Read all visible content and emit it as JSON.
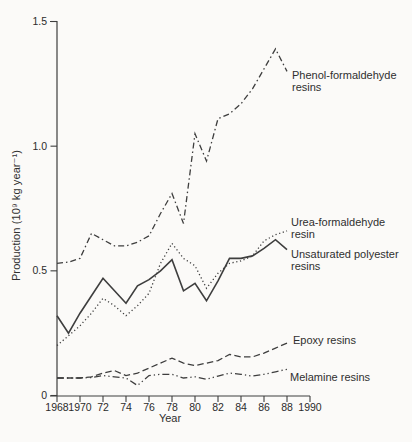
{
  "figure": {
    "background_color": "#fbfaf8",
    "ink_color": "#3e3e3e",
    "text_color": "#2f2f2f"
  },
  "chart_data": {
    "type": "line",
    "title": "",
    "xlabel": "Year",
    "ylabel": "Production (10⁹ kg year⁻¹)",
    "xlim": [
      1968,
      1990
    ],
    "ylim": [
      0,
      1.5
    ],
    "grid": false,
    "legend_position": "inline-annotations-right",
    "x_ticks": [
      1968,
      1970,
      1972,
      1974,
      1976,
      1978,
      1980,
      1982,
      1984,
      1986,
      1988,
      1990
    ],
    "x_tick_labels": [
      "1968",
      "1970",
      "72",
      "74",
      "76",
      "78",
      "80",
      "82",
      "84",
      "86",
      "88",
      "1990"
    ],
    "y_ticks": [
      0,
      0.5,
      1.0,
      1.5
    ],
    "y_tick_labels": [
      "0",
      "0.5",
      "1.0",
      "1.5"
    ],
    "x": [
      1968,
      1969,
      1970,
      1971,
      1972,
      1973,
      1974,
      1975,
      1976,
      1977,
      1978,
      1979,
      1980,
      1981,
      1982,
      1983,
      1984,
      1985,
      1986,
      1987,
      1988
    ],
    "series": [
      {
        "name": "Phenol-formaldehyde resins",
        "label_lines": [
          "Phenol-formaldehyde",
          "resins"
        ],
        "line_style": "dash-dot",
        "values": [
          0.53,
          0.535,
          0.55,
          0.65,
          0.625,
          0.6,
          0.6,
          0.615,
          0.64,
          0.73,
          0.81,
          0.69,
          1.05,
          0.94,
          1.11,
          1.13,
          1.17,
          1.23,
          1.31,
          1.39,
          1.3
        ],
        "label_xy": [
          292,
          69
        ]
      },
      {
        "name": "Urea-formaldehyde resin",
        "label_lines": [
          "Urea-formaldehyde",
          "resin"
        ],
        "line_style": "dotted",
        "values": [
          0.2,
          0.24,
          0.28,
          0.33,
          0.39,
          0.36,
          0.32,
          0.36,
          0.41,
          0.53,
          0.61,
          0.55,
          0.52,
          0.43,
          0.49,
          0.53,
          0.54,
          0.56,
          0.62,
          0.645,
          0.66
        ],
        "label_xy": [
          291,
          216
        ]
      },
      {
        "name": "Unsaturated polyester resins",
        "label_lines": [
          "Unsaturated polyester",
          "resins"
        ],
        "line_style": "solid",
        "values": [
          0.32,
          0.25,
          0.33,
          0.4,
          0.47,
          0.42,
          0.37,
          0.44,
          0.465,
          0.5,
          0.545,
          0.42,
          0.45,
          0.38,
          0.46,
          0.55,
          0.55,
          0.56,
          0.59,
          0.625,
          0.585
        ],
        "label_xy": [
          291,
          248
        ]
      },
      {
        "name": "Epoxy resins",
        "label_lines": [
          "Epoxy resins"
        ],
        "line_style": "dashed",
        "values": [
          0.07,
          0.07,
          0.07,
          0.075,
          0.09,
          0.1,
          0.08,
          0.09,
          0.11,
          0.13,
          0.15,
          0.13,
          0.12,
          0.13,
          0.14,
          0.165,
          0.155,
          0.155,
          0.17,
          0.19,
          0.21
        ],
        "label_xy": [
          293,
          334
        ]
      },
      {
        "name": "Melamine resins",
        "label_lines": [
          "Melamine resins"
        ],
        "line_style": "dash-dot-dot",
        "values": [
          0.07,
          0.07,
          0.07,
          0.072,
          0.08,
          0.075,
          0.07,
          0.04,
          0.08,
          0.085,
          0.085,
          0.07,
          0.075,
          0.065,
          0.078,
          0.09,
          0.085,
          0.078,
          0.085,
          0.095,
          0.105
        ],
        "label_xy": [
          290,
          371
        ]
      }
    ]
  }
}
